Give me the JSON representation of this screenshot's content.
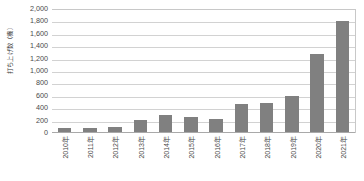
{
  "chart_data": {
    "type": "bar",
    "title": "",
    "subtitle": "",
    "xlabel": "",
    "ylabel": "打ち上げ数（機）",
    "categories": [
      "2010年",
      "2011年",
      "2012年",
      "2013年",
      "2014年",
      "2015年",
      "2016年",
      "2017年",
      "2018年",
      "2019年",
      "2020年",
      "2021年"
    ],
    "values": [
      75,
      85,
      90,
      210,
      290,
      265,
      230,
      470,
      480,
      590,
      1280,
      1810
    ],
    "series": [
      {
        "name": "打ち上げ数",
        "values": [
          75,
          85,
          90,
          210,
          290,
          265,
          230,
          470,
          480,
          590,
          1280,
          1810
        ]
      }
    ],
    "ylim": [
      0,
      2000
    ],
    "ytick_labels": [
      "2,000",
      "1,800",
      "1,600",
      "1,400",
      "1,200",
      "1,000",
      "800",
      "600",
      "400",
      "200",
      "0"
    ],
    "ytick_values": [
      2000,
      1800,
      1600,
      1400,
      1200,
      1000,
      800,
      600,
      400,
      200,
      0
    ],
    "grid": true,
    "grid_axis": "y",
    "legend": false,
    "legend_position": "none",
    "bar_color": "#808080",
    "gridline_color": "#d2d2d2",
    "axis_color": "#a9a9a9",
    "background_color": "#ffffff",
    "text_color": "#4a4a4a"
  }
}
